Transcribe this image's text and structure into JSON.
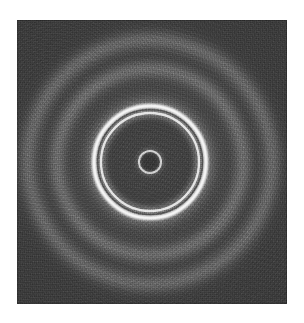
{
  "figure": {
    "kind": "diffraction-pattern-micrograph",
    "description": "Electron diffraction pattern: concentric Debye-Scherrer rings on a dark photographic plate",
    "page_background": "#ffffff",
    "plate": {
      "background": "#3b3b3b",
      "left_px": 17,
      "top_px": 20,
      "width_px": 270,
      "height_px": 284,
      "grain": "film-grain",
      "border_color": "#2f2f2f"
    },
    "pattern_center": {
      "x_px": 150,
      "y_px": 162
    },
    "rings": [
      {
        "name": "central-beam-ring",
        "order": 1,
        "radius_px": 11,
        "thickness_px": 2,
        "intensity": "medium",
        "sharpness": "sharp",
        "color": "#d8d8d8"
      },
      {
        "name": "inner-bright-ring",
        "order": 2,
        "radius_px": 49,
        "thickness_px": 2.5,
        "intensity": "high",
        "sharpness": "sharp",
        "color": "#e8e8e8"
      },
      {
        "name": "principal-bright-ring",
        "order": 3,
        "radius_px": 56,
        "thickness_px": 5,
        "intensity": "very-high",
        "sharpness": "sharp",
        "color": "#ffffff"
      },
      {
        "name": "middle-diffuse-ring",
        "order": 4,
        "radius_px": 93,
        "thickness_px": 7,
        "intensity": "low",
        "sharpness": "diffuse",
        "color": "#8a8a8a"
      },
      {
        "name": "outer-diffuse-ring",
        "order": 5,
        "radius_px": 122,
        "thickness_px": 9,
        "intensity": "very-low",
        "sharpness": "diffuse",
        "color": "#7c7c7c"
      }
    ],
    "chart_data": {
      "type": "line",
      "title": "Radial intensity profile of diffraction rings",
      "xlabel": "Radius (px from pattern center)",
      "ylabel": "Relative intensity (0-1)",
      "xlim": [
        0,
        140
      ],
      "ylim": [
        0,
        1
      ],
      "grid": false,
      "legend": "none",
      "x": [
        0,
        11,
        25,
        49,
        56,
        70,
        93,
        110,
        122,
        140
      ],
      "values": [
        0.3,
        0.55,
        0.18,
        0.8,
        1.0,
        0.17,
        0.38,
        0.16,
        0.33,
        0.14
      ],
      "annotations": [
        "r=11 central beam ring",
        "r=49 inner bright ring",
        "r=56 principal bright ring",
        "r=93 middle diffuse ring",
        "r=122 outer diffuse ring"
      ]
    }
  }
}
